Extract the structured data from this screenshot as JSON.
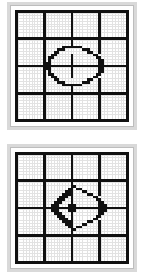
{
  "figure": {
    "panel_count": 2,
    "background_color": "#ffffff",
    "panel_frame_color": "#d9d9d9",
    "panel_face_color": "#ffffff",
    "fine_grid_color": "#e2e2e2",
    "heavy_grid_color": "#111111",
    "motif_color": "#111111"
  },
  "chart_data": [
    {
      "type": "heatmap",
      "name": "panel-one",
      "title": "Circle motif on 4x4 heavy grid",
      "cols": 41,
      "rows": 41,
      "heavy_grid_lines": [
        0,
        10,
        20,
        30,
        40
      ],
      "heavy_line_weight": 1,
      "fine_grid": true,
      "legend": "none",
      "motif": "circle-with-cross",
      "pixels": [
        "11111111111111111111111111111111111111111",
        "10000000001000000000100000000010000000001",
        "10000000001000000000100000000010000000001",
        "10000000001000000000100000000010000000001",
        "10000000001000000000100000000010000000001",
        "10000000001000000000100000000010000000001",
        "10000000001000000000100000000010000000001",
        "10000000001000000000100000000010000000001",
        "10000000001000000000100000000010000000001",
        "10000000001000000000100000000010000000001",
        "11111111111111111111111111111111111111111",
        "10000000001000000000100000000010000000001",
        "10000000001000000000100000000010000000001",
        "10000000001000000111111100000010000000001",
        "10000000001000011100000011100010000000001",
        "10000000001000110000000000110010000000001",
        "10000000001001100000100000001100000000001",
        "10000000001011000000100000000110000000001",
        "10000000001010000000100000000011000000001",
        "10000000001110000000100000000011000000001",
        "11111111111111111111111111111111111111111",
        "10000000001110000000100000000011000000001",
        "10000000001010000000100000000011000000001",
        "10000000001011000000100000000110000000001",
        "10000000001001100000100000001100000000001",
        "10000000001000110000000000110010000000001",
        "10000000001000011100000011100010000000001",
        "10000000001000000111111100000010000000001",
        "10000000001000000000100000000010000000001",
        "10000000001000000000100000000010000000001",
        "11111111111111111111111111111111111111111",
        "10000000001000000000100000000010000000001",
        "10000000001000000000100000000010000000001",
        "10000000001000000000100000000010000000001",
        "10000000001000000000100000000010000000001",
        "10000000001000000000100000000010000000001",
        "10000000001000000000100000000010000000001",
        "10000000001000000000100000000010000000001",
        "10000000001000000000100000000010000000001",
        "10000000001000000000100000000010000000001",
        "11111111111111111111111111111111111111111"
      ]
    },
    {
      "type": "heatmap",
      "name": "panel-two",
      "title": "Diamond motif with radiating diagonals on 4x4 heavy grid",
      "cols": 41,
      "rows": 41,
      "heavy_grid_lines": [
        0,
        10,
        20,
        30,
        40
      ],
      "heavy_line_weight": 1,
      "fine_grid": true,
      "legend": "none",
      "motif": "diamond-with-diagonal-rays",
      "pixels": [
        "11111111111111111111111111111111111111111",
        "10000000001000000000100000000010000000001",
        "10000000001000000000100000000010000000001",
        "10000000001000000000100000000010000000001",
        "10000000001000000000100000000010000000001",
        "10000000001000000000100000000010000000001",
        "10000000001000000000100000000010000000001",
        "10000000001000000000100000000010000000001",
        "10000000001000000000100000000010000000001",
        "10000000001000000000100000000010000000001",
        "11111111111111111111111111111111111111111",
        "10000000001000000000100000000010000000001",
        "10000000001000000000110000000010000000001",
        "10000000001000000001101100000010000000001",
        "10000000001000000011100011000010000000001",
        "10000000001000000111100000110010000000001",
        "10000000001000001110100000001100000000001",
        "10000000001000011100100000000110000000001",
        "10000000001000111000100000000011000000001",
        "10000000001001110001110000000011100000001",
        "11111111111111111111111111111111111111111",
        "10000000001001110001110000000011100000001",
        "10000000001000111000100000000011000000001",
        "10000000001000011100100000000110000000001",
        "10000000001000001110100000001100000000001",
        "10000000001000000111100000110010000000001",
        "10000000001000000011100011000010000000001",
        "10000000001000000001101100000010000000001",
        "10000000001000000000110000000010000000001",
        "10000000001000000000100000000010000000001",
        "11111111111111111111111111111111111111111",
        "10000000001000000000100000000010000000001",
        "10000000001000000000100000000010000000001",
        "10000000001000000000100000000010000000001",
        "10000000001000000000100000000010000000001",
        "10000000001000000000100000000010000000001",
        "10000000001000000000100000000010000000001",
        "10000000001000000000100000000010000000001",
        "10000000001000000000100000000010000000001",
        "10000000001000000000100000000010000000001",
        "11111111111111111111111111111111111111111"
      ]
    }
  ]
}
